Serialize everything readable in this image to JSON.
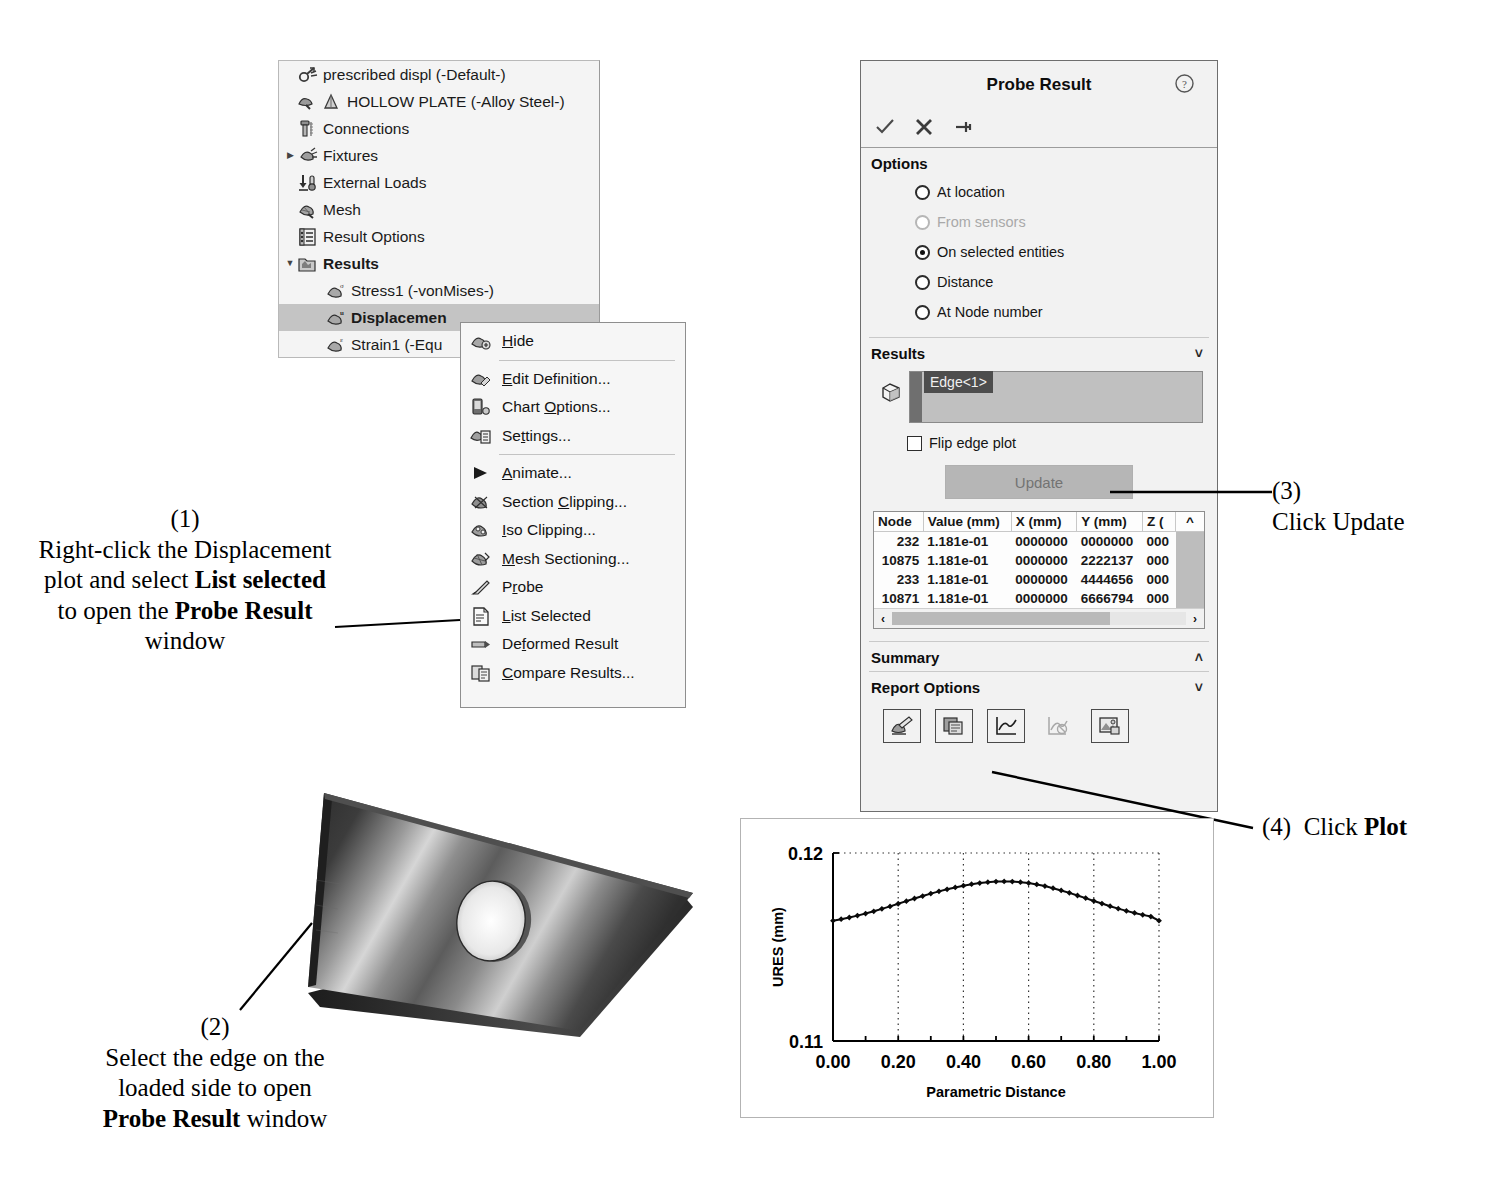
{
  "tree": {
    "items": [
      {
        "label": "prescribed displ (-Default-)",
        "icon": "study-icon",
        "indent": 0,
        "arrow": "",
        "bold": false,
        "selected": false
      },
      {
        "label": "HOLLOW PLATE (-Alloy Steel-)",
        "icon": "part-material-icon",
        "indent": 1,
        "arrow": "",
        "bold": false,
        "selected": false
      },
      {
        "label": "Connections",
        "icon": "connections-icon",
        "indent": 1,
        "arrow": "",
        "bold": false,
        "selected": false
      },
      {
        "label": "Fixtures",
        "icon": "fixtures-icon",
        "indent": 1,
        "arrow": "collapsed",
        "bold": false,
        "selected": false
      },
      {
        "label": "External Loads",
        "icon": "external-loads-icon",
        "indent": 1,
        "arrow": "",
        "bold": false,
        "selected": false
      },
      {
        "label": "Mesh",
        "icon": "mesh-icon",
        "indent": 1,
        "arrow": "",
        "bold": false,
        "selected": false
      },
      {
        "label": "Result Options",
        "icon": "result-options-icon",
        "indent": 1,
        "arrow": "",
        "bold": false,
        "selected": false
      },
      {
        "label": "Results",
        "icon": "results-folder-icon",
        "indent": 1,
        "arrow": "expanded",
        "bold": true,
        "selected": false
      },
      {
        "label": "Stress1 (-vonMises-)",
        "icon": "plot-icon",
        "indent": 2,
        "arrow": "",
        "bold": false,
        "selected": false
      },
      {
        "label": "Displacemen",
        "icon": "plot-icon",
        "indent": 2,
        "arrow": "",
        "bold": true,
        "selected": true
      },
      {
        "label": "Strain1 (-Equ",
        "icon": "plot-icon",
        "indent": 2,
        "arrow": "",
        "bold": false,
        "selected": false
      }
    ]
  },
  "context_menu": {
    "groups": [
      [
        {
          "label": "Hide",
          "icon": "hide-icon",
          "accel": "H"
        }
      ],
      [
        {
          "label": "Edit Definition...",
          "icon": "edit-definition-icon",
          "accel": "E"
        },
        {
          "label": "Chart Options...",
          "icon": "chart-options-icon",
          "accel": "O"
        },
        {
          "label": "Settings...",
          "icon": "settings-icon",
          "accel": "t"
        }
      ],
      [
        {
          "label": "Animate...",
          "icon": "animate-icon",
          "accel": "A"
        },
        {
          "label": "Section Clipping...",
          "icon": "section-clipping-icon",
          "accel": "C"
        },
        {
          "label": "Iso Clipping...",
          "icon": "iso-clipping-icon",
          "accel": "I"
        },
        {
          "label": "Mesh Sectioning...",
          "icon": "mesh-sectioning-icon",
          "accel": "M"
        },
        {
          "label": "Probe",
          "icon": "probe-icon",
          "accel": "r"
        },
        {
          "label": "List Selected",
          "icon": "list-selected-icon",
          "accel": "L"
        },
        {
          "label": "Deformed Result",
          "icon": "deformed-result-icon",
          "accel": "f"
        },
        {
          "label": "Compare Results...",
          "icon": "compare-results-icon",
          "accel": "C"
        }
      ]
    ]
  },
  "probe": {
    "title": "Probe Result",
    "help_icon": "help-icon",
    "toolbar": [
      {
        "name": "accept-button",
        "icon": "check-icon"
      },
      {
        "name": "cancel-button",
        "icon": "x-icon"
      },
      {
        "name": "pin-button",
        "icon": "pin-icon"
      }
    ],
    "options": {
      "header": "Options",
      "radios": [
        {
          "label": "At location",
          "selected": false,
          "disabled": false
        },
        {
          "label": "From sensors",
          "selected": false,
          "disabled": true
        },
        {
          "label": "On selected entities",
          "selected": true,
          "disabled": false
        },
        {
          "label": "Distance",
          "selected": false,
          "disabled": false
        },
        {
          "label": "At Node number",
          "selected": false,
          "disabled": false
        }
      ]
    },
    "results": {
      "header": "Results",
      "chevron": "up",
      "selection_icon": "face-selection-icon",
      "selection_items": [
        "Edge<1>"
      ],
      "flip_label": "Flip edge plot",
      "flip_checked": false,
      "update_label": "Update",
      "table": {
        "columns": [
          "Node",
          "Value (mm)",
          "X (mm)",
          "Y (mm)",
          "Z ("
        ],
        "rows": [
          [
            "232",
            "1.181e-01",
            "0000000",
            "0000000",
            "000"
          ],
          [
            "10875",
            "1.181e-01",
            "0000000",
            "2222137",
            "000"
          ],
          [
            "233",
            "1.181e-01",
            "0000000",
            "4444656",
            "000"
          ],
          [
            "10871",
            "1.181e-01",
            "0000000",
            "6666794",
            "000"
          ]
        ]
      }
    },
    "summary": {
      "header": "Summary",
      "chevron": "down"
    },
    "report_options": {
      "header": "Report Options",
      "chevron": "up",
      "buttons": [
        {
          "name": "save-as-sensor-button",
          "icon": "save-sensor-icon",
          "bordered": true
        },
        {
          "name": "save-to-file-button",
          "icon": "save-file-icon",
          "bordered": true
        },
        {
          "name": "plot-button",
          "icon": "plot-chart-icon",
          "bordered": true
        },
        {
          "name": "clear-plot-button",
          "icon": "clear-plot-icon",
          "bordered": false
        },
        {
          "name": "save-plot-image-button",
          "icon": "save-image-icon",
          "bordered": true
        }
      ]
    }
  },
  "chart_data": {
    "type": "line",
    "title": "",
    "xlabel": "Parametric Distance",
    "ylabel": "URES (mm)",
    "xlim": [
      0.0,
      1.0
    ],
    "ylim": [
      0.11,
      0.12
    ],
    "xticks": [
      "0.00",
      "0.20",
      "0.40",
      "0.60",
      "0.80",
      "1.00"
    ],
    "xtick_values": [
      0.0,
      0.2,
      0.4,
      0.6,
      0.8,
      1.0
    ],
    "xminor_values": [
      0.1,
      0.3,
      0.5,
      0.7,
      0.9
    ],
    "yticks": [
      "0.11",
      "0.12"
    ],
    "ytick_values": [
      0.11,
      0.12
    ],
    "grid": "vertical-dotted",
    "legend": "none",
    "marker": "diamond",
    "series": [
      {
        "name": "URES",
        "x": [
          0.0,
          0.025,
          0.05,
          0.075,
          0.1,
          0.125,
          0.15,
          0.175,
          0.2,
          0.225,
          0.25,
          0.275,
          0.3,
          0.325,
          0.35,
          0.375,
          0.4,
          0.425,
          0.45,
          0.475,
          0.5,
          0.525,
          0.55,
          0.575,
          0.6,
          0.625,
          0.65,
          0.675,
          0.7,
          0.725,
          0.75,
          0.775,
          0.8,
          0.825,
          0.85,
          0.875,
          0.9,
          0.925,
          0.95,
          0.975,
          1.0
        ],
        "y": [
          0.1164,
          0.11648,
          0.11657,
          0.11667,
          0.11678,
          0.1169,
          0.11703,
          0.11716,
          0.1173,
          0.11744,
          0.11758,
          0.11771,
          0.11784,
          0.11796,
          0.11807,
          0.11817,
          0.11826,
          0.11834,
          0.1184,
          0.11845,
          0.11848,
          0.11849,
          0.11848,
          0.11845,
          0.1184,
          0.11833,
          0.11824,
          0.11813,
          0.11801,
          0.11788,
          0.11774,
          0.1176,
          0.11745,
          0.11731,
          0.11717,
          0.11704,
          0.11692,
          0.11681,
          0.11671,
          0.11662,
          0.1164
        ]
      }
    ]
  },
  "annotations": [
    {
      "number": "(1)",
      "lines": [
        [
          {
            "t": "Right-click the Displacement",
            "b": false
          }
        ],
        [
          {
            "t": "plot and select ",
            "b": false
          },
          {
            "t": "List selected",
            "b": true
          }
        ],
        [
          {
            "t": "to open the ",
            "b": false
          },
          {
            "t": "Probe Result",
            "b": true
          }
        ],
        [
          {
            "t": "window",
            "b": false
          }
        ]
      ]
    },
    {
      "number": "(2)",
      "lines": [
        [
          {
            "t": "Select the edge on the",
            "b": false
          }
        ],
        [
          {
            "t": "loaded side to open",
            "b": false
          }
        ],
        [
          {
            "t": "Probe Result",
            "b": true
          },
          {
            "t": " window",
            "b": false
          }
        ]
      ]
    },
    {
      "number": "(3)",
      "lines": [
        [
          {
            "t": "Click Update",
            "b": false
          }
        ]
      ]
    },
    {
      "number": "(4)",
      "lines": [
        [
          {
            "t": "Click ",
            "b": false
          },
          {
            "t": "Plot",
            "b": true
          }
        ]
      ]
    }
  ]
}
